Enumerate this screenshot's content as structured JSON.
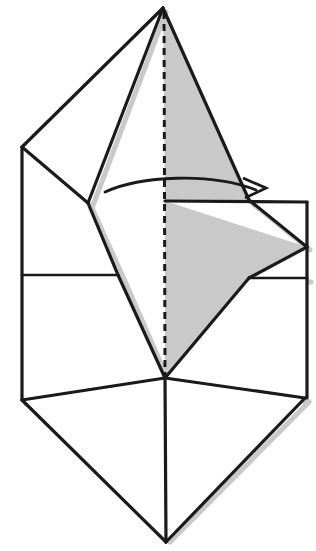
{
  "figure": {
    "kind": "line-drawing",
    "background_color": "#ffffff",
    "line_color": "#1a1a1a",
    "shade_color": "#c9c9c9",
    "width": 316,
    "height": 551
  },
  "geometry": {
    "apex": "163,8",
    "left_vertex": "22,147",
    "left_junction": "88,203",
    "center_spine_top": "164,8",
    "center_fold_mid": "165,202",
    "center_v_junction": "165,378",
    "bottom_tip": "166,542",
    "left_lower_corner": "22,400",
    "right_lower_corner": "305,398",
    "right_upper_corner": "307,202",
    "right_diamond_vertex": "307,248",
    "right_notch": "307,278",
    "shaded_triangle_foot": "247,200"
  },
  "shapes": {
    "shaded_upper_triangle": "163,8 165,202 247,200",
    "shaded_lower_diamond": "165,202 307,247 249,278 165,378",
    "white_top_left_face": "163,8 22,147 88,203",
    "white_left_panel": "22,147 88,203 118,275 22,275",
    "white_left_lower": "22,275 118,275 165,378 22,400",
    "white_right_upper": "247,200 307,202 307,247",
    "white_right_lower": "249,278 307,278 307,398 165,378",
    "white_bottom_left": "22,400 165,378 166,542",
    "white_bottom_right": "166,542 165,378 305,398"
  },
  "elements": {
    "center_crease": {
      "name": "dashed-center-crease",
      "style": "dashed",
      "path": "164,10 to 165,540"
    },
    "fold_arrow": {
      "name": "fold-arrow",
      "style": "curved-arrow",
      "direction": "left-to-right",
      "start": "105,191",
      "end": "258,189",
      "head_tip": "266,187"
    },
    "horizontal_fold_left": {
      "name": "horizontal-crease-left",
      "path": "22,275 to 118,275"
    },
    "horizontal_fold_right": {
      "name": "horizontal-crease-right",
      "path": "165,201 to 247,200"
    }
  }
}
